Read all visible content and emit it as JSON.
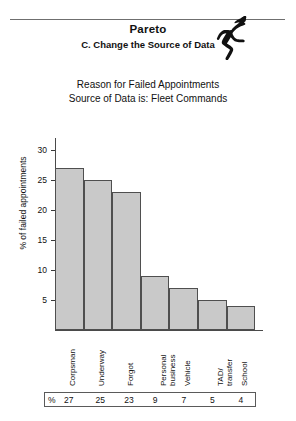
{
  "header": {
    "title": "Pareto",
    "subtitle": "C. Change the Source of Data",
    "icon": "running-figure-icon"
  },
  "caption": {
    "line1": "Reason for Failed Appointments",
    "line2": "Source of Data is: Fleet Commands"
  },
  "value_strip": {
    "unit_symbol": "%",
    "values": [
      "27",
      "25",
      "23",
      "9",
      "7",
      "5",
      "4"
    ]
  },
  "chart_data": {
    "type": "bar",
    "title": "Reason for Failed Appointments",
    "subtitle": "Source of Data is: Fleet Commands",
    "categories": [
      "Corpsman",
      "Underway",
      "Forgot",
      "Personal\nbusiness",
      "Vehicle",
      "TAD/\ntransfer",
      "School"
    ],
    "values": [
      27,
      25,
      23,
      9,
      7,
      5,
      4
    ],
    "xlabel": "",
    "ylabel": "% of failed appointments",
    "ylim": [
      0,
      32
    ],
    "yticks": [
      5,
      10,
      15,
      20,
      25,
      30
    ],
    "ytick_labels": [
      "5",
      "10",
      "15",
      "20",
      "25",
      "30"
    ],
    "grid": false,
    "legend": false,
    "bar_fill": "#c9c9c9",
    "bar_stroke": "#4f4f4f"
  }
}
